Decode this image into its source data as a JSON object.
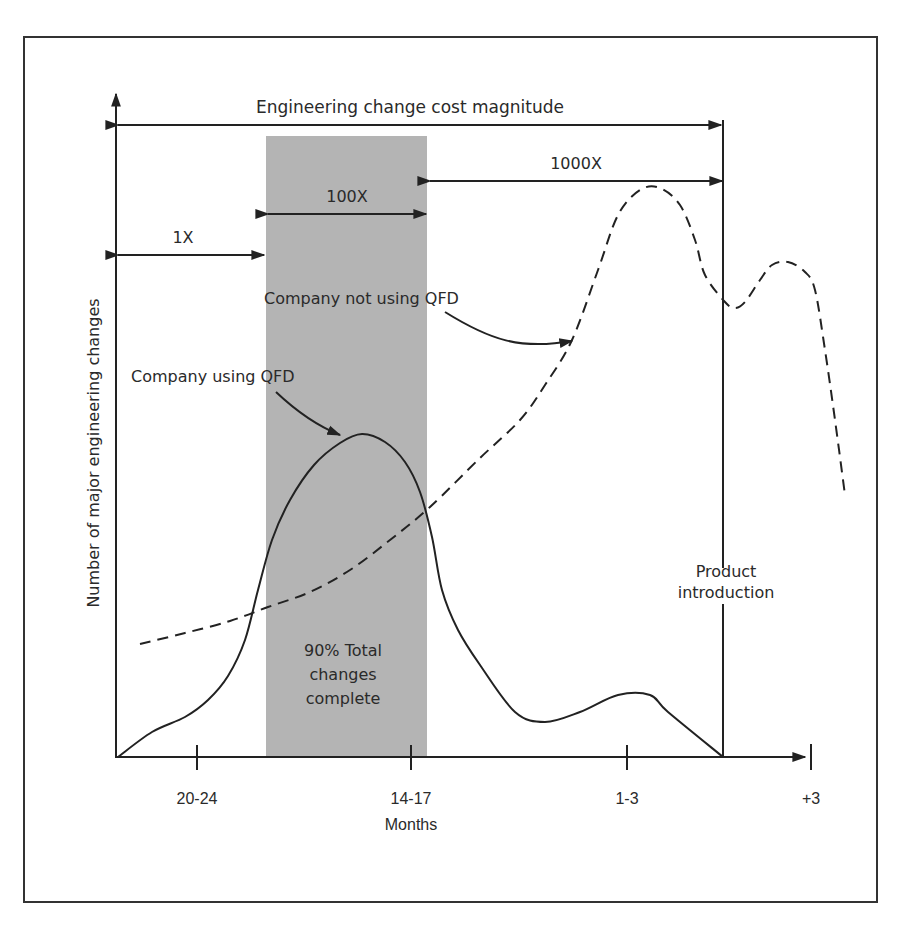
{
  "figure": {
    "title_arrow_label": "Engineering change cost magnitude",
    "y_axis_label": "Number of major engineering changes",
    "x_axis_label": "Months",
    "band_label_lines": [
      "90% Total",
      "changes",
      "complete"
    ],
    "cost_ranges": [
      {
        "label": "1X",
        "x1": 118,
        "x2": 264,
        "y": 255
      },
      {
        "label": "100X",
        "x1": 268,
        "x2": 426,
        "y": 214
      },
      {
        "label": "1000X",
        "x1": 430,
        "x2": 722,
        "y": 181
      }
    ],
    "product_intro_label_lines": [
      "Product",
      "introduction"
    ],
    "curve_labels": {
      "using_qfd": "Company using QFD",
      "not_using_qfd": "Company not using QFD"
    },
    "colors": {
      "line": "#222222",
      "band": "#b4b4b4",
      "frame": "#333333",
      "text": "#2a2a2a"
    }
  },
  "chart_data": {
    "type": "line",
    "title": "Engineering change cost magnitude",
    "xlabel": "Months",
    "ylabel": "Number of major engineering changes",
    "x_ticks": [
      "20-24",
      "14-17",
      "1-3",
      "+3"
    ],
    "x_tick_positions_px": [
      197,
      411,
      627,
      811
    ],
    "annotations": [
      {
        "text": "1X",
        "type": "cost_range",
        "span": "start to shaded band"
      },
      {
        "text": "100X",
        "type": "cost_range",
        "span": "shaded band"
      },
      {
        "text": "1000X",
        "type": "cost_range",
        "span": "shaded band to product introduction"
      },
      {
        "text": "90% Total changes complete",
        "type": "shaded_region"
      },
      {
        "text": "Product introduction",
        "type": "vertical_line"
      }
    ],
    "series": [
      {
        "name": "Company using QFD",
        "style": "solid",
        "points_px": [
          [
            118,
            757
          ],
          [
            152,
            732
          ],
          [
            185,
            717
          ],
          [
            208,
            700
          ],
          [
            228,
            676
          ],
          [
            245,
            640
          ],
          [
            258,
            590
          ],
          [
            272,
            540
          ],
          [
            290,
            500
          ],
          [
            314,
            465
          ],
          [
            340,
            443
          ],
          [
            362,
            434
          ],
          [
            385,
            442
          ],
          [
            405,
            462
          ],
          [
            420,
            492
          ],
          [
            432,
            537
          ],
          [
            442,
            590
          ],
          [
            458,
            630
          ],
          [
            480,
            665
          ],
          [
            515,
            712
          ],
          [
            545,
            722
          ],
          [
            580,
            712
          ],
          [
            618,
            695
          ],
          [
            650,
            695
          ],
          [
            668,
            712
          ],
          [
            723,
            757
          ]
        ]
      },
      {
        "name": "Company not using QFD",
        "style": "dashed",
        "points_px": [
          [
            140,
            644
          ],
          [
            185,
            633
          ],
          [
            230,
            621
          ],
          [
            268,
            607
          ],
          [
            310,
            592
          ],
          [
            350,
            570
          ],
          [
            390,
            540
          ],
          [
            430,
            507
          ],
          [
            480,
            458
          ],
          [
            520,
            420
          ],
          [
            545,
            385
          ],
          [
            572,
            340
          ],
          [
            598,
            270
          ],
          [
            618,
            215
          ],
          [
            640,
            190
          ],
          [
            660,
            188
          ],
          [
            680,
            205
          ],
          [
            695,
            240
          ],
          [
            705,
            275
          ],
          [
            725,
            302
          ],
          [
            735,
            308
          ],
          [
            745,
            302
          ],
          [
            760,
            280
          ],
          [
            772,
            265
          ],
          [
            788,
            262
          ],
          [
            805,
            272
          ],
          [
            815,
            290
          ],
          [
            825,
            350
          ],
          [
            835,
            420
          ],
          [
            845,
            495
          ]
        ]
      }
    ],
    "shaded_region_px": {
      "x1": 266,
      "x2": 427,
      "y1": 136,
      "y2": 757
    },
    "product_introduction_x_px": 723
  }
}
